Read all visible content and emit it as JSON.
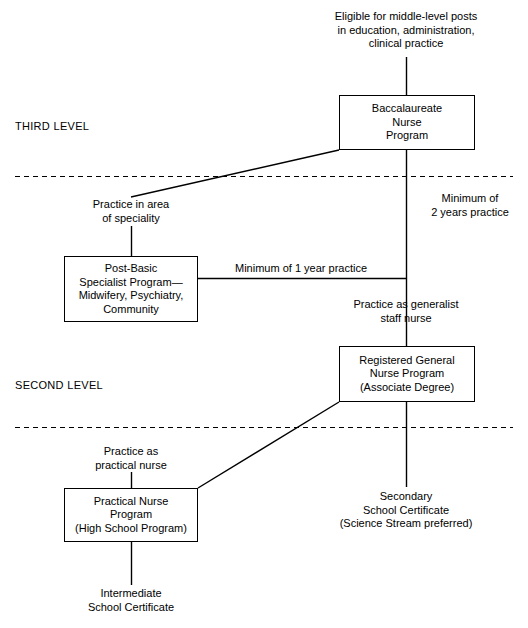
{
  "diagram": {
    "stroke_color": "#000000",
    "background_color": "#ffffff"
  },
  "levels": [
    {
      "id": "third",
      "label": "THIRD LEVEL"
    },
    {
      "id": "second",
      "label": "SECOND LEVEL"
    }
  ],
  "boxes": [
    {
      "id": "baccalaureate",
      "text": "Baccalaureate\nNurse\nProgram"
    },
    {
      "id": "post-basic",
      "text": "Post-Basic\nSpecialist Program—\nMidwifery, Psychiatry,\nCommunity"
    },
    {
      "id": "registered-general-nurse",
      "text": "Registered General\nNurse Program\n(Associate Degree)"
    },
    {
      "id": "practical-nurse",
      "text": "Practical Nurse\nProgram\n(High School Program)"
    }
  ],
  "labels": [
    {
      "id": "top-outcome",
      "text": "Eligible for middle-level posts\nin education, administration,\nclinical practice"
    },
    {
      "id": "practice-speciality",
      "text": "Practice in area\nof speciality"
    },
    {
      "id": "minimum-two-years",
      "text": "Minimum of\n2 years practice"
    },
    {
      "id": "practice-generalist",
      "text": "Practice as generalist\nstaff nurse"
    },
    {
      "id": "practice-practical-nurse",
      "text": "Practice as\npractical nurse"
    },
    {
      "id": "secondary-school-certificate",
      "text": "Secondary\nSchool Certificate\n(Science Stream preferred)"
    },
    {
      "id": "intermediate-school-certificate",
      "text": "Intermediate\nSchool Certificate"
    }
  ],
  "edge_labels": [
    {
      "id": "minimum-one-year",
      "text": "Minimum of 1 year practice"
    }
  ]
}
